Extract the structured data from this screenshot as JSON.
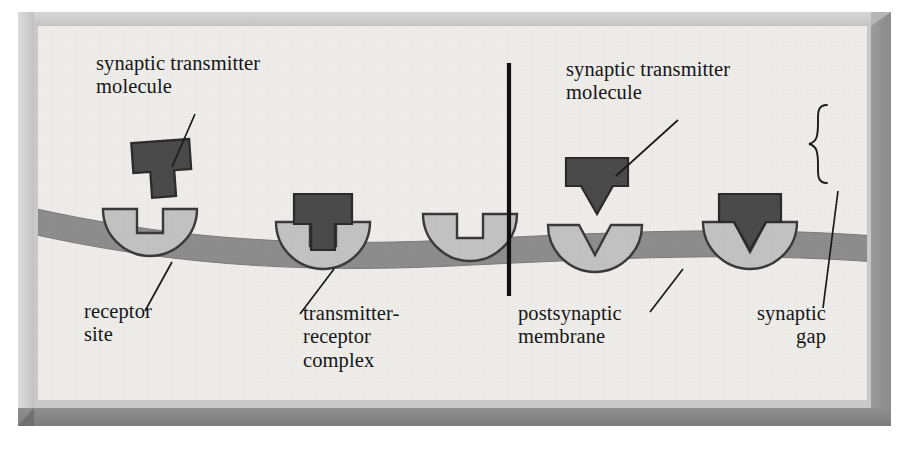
{
  "figure": {
    "kind": "neuroscience-diagram",
    "panel_count": 2
  },
  "colors": {
    "page_background": "#ffffff",
    "frame_face": "#c9c9c9",
    "frame_highlight": "#dcdcdc",
    "frame_shadow": "#7d7d7d",
    "panel_background": "#eeedea",
    "membrane": "#8d8d8d",
    "membrane_outline": "#6f6f6f",
    "receptor_fill": "#c2c2c2",
    "receptor_outline": "#3a3a3a",
    "molecule_fill": "#4a4a4a",
    "molecule_outline": "#2b2b2b",
    "divider": "#111111",
    "leader_line": "#1a1a1a",
    "text": "#161616"
  },
  "left_panel": {
    "name": "unbound-and-bound-T-shaped-transmitter",
    "labels": {
      "transmitter": "synaptic transmitter\nmolecule",
      "receptor_site": "receptor\nsite",
      "complex": "transmitter-\nreceptor\ncomplex"
    },
    "receptors": [
      {
        "id": "receptor-1",
        "notch": "T",
        "occupied": false
      },
      {
        "id": "receptor-2",
        "notch": "T",
        "occupied": true
      },
      {
        "id": "receptor-3",
        "notch": "T",
        "occupied": false
      }
    ],
    "molecules": [
      {
        "id": "molecule-free-left",
        "shape": "T",
        "state": "free"
      },
      {
        "id": "molecule-bound-left",
        "shape": "T",
        "state": "bound"
      }
    ]
  },
  "right_panel": {
    "name": "unbound-and-bound-V-shaped-transmitter",
    "labels": {
      "transmitter": "synaptic transmitter\nmolecule",
      "postsynaptic_membrane": "postsynaptic\nmembrane",
      "synaptic_gap": "synaptic\ngap"
    },
    "receptors": [
      {
        "id": "receptor-4",
        "notch": "V",
        "occupied": false
      },
      {
        "id": "receptor-5",
        "notch": "V",
        "occupied": true
      }
    ],
    "molecules": [
      {
        "id": "molecule-free-right",
        "shape": "V",
        "state": "free"
      },
      {
        "id": "molecule-bound-right",
        "shape": "V",
        "state": "bound"
      }
    ],
    "bracket": {
      "name": "synaptic-gap-brace",
      "glyph": "}"
    }
  }
}
